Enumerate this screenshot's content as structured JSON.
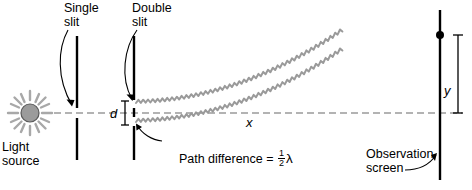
{
  "figure": {
    "labels": {
      "single_slit": "Single\nslit",
      "double_slit": "Double\nslit",
      "light_source": "Light\nsource",
      "observation_screen": "Observation\nscreen",
      "slit_separation": "d",
      "distance_to_screen": "x",
      "fringe_position": "y",
      "path_difference_prefix": "Path difference = ",
      "path_difference_numerator": "1",
      "path_difference_denominator": "2",
      "path_difference_unit": "λ"
    },
    "colors": {
      "ink": "#000000",
      "wave": "#9a9a9a",
      "axis": "#9a9a9a",
      "source_fill": "#9b9b9b",
      "source_rays": "#a8a8a8",
      "background": "#ffffff"
    },
    "geometry": {
      "axis_y": 113,
      "source_x": 30,
      "single_slit_x": 77,
      "double_slit_x": 134,
      "screen_x": 440,
      "slit_upper_y": 103,
      "slit_lower_y": 122,
      "spot_x": 440,
      "spot_y": 35
    }
  }
}
